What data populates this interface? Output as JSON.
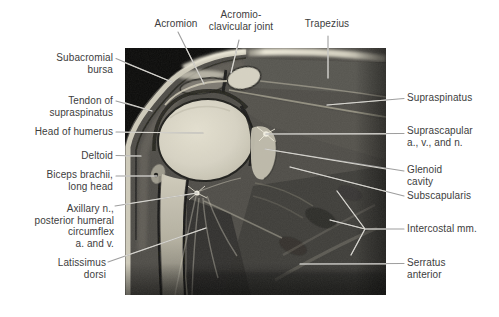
{
  "figure": {
    "type": "labeled-anatomy-mri",
    "region": "shoulder, coronal section"
  },
  "colors": {
    "background": "#ffffff",
    "label_text": "#3d3d3d",
    "leader_line_outside": "#9e9e9e",
    "leader_line_on_image": "#d8d6cf",
    "mri_background": "#0a0a09",
    "muscle_gray": "#4e4c47",
    "bone_marrow_bright": "#d9d5c5",
    "fat_band_bright": "#ece8d8",
    "cortex_dark": "#1e1e1b"
  },
  "labels": {
    "top": {
      "acromion": {
        "lines": [
          "Acromion"
        ]
      },
      "ac_joint": {
        "lines": [
          "Acromio-",
          "clavicular joint"
        ]
      },
      "trapezius": {
        "lines": [
          "Trapezius"
        ]
      }
    },
    "left": {
      "subacromial_bursa": {
        "lines": [
          "Subacromial",
          "bursa"
        ]
      },
      "tendon_supraspinatus": {
        "lines": [
          "Tendon of",
          "supraspinatus"
        ]
      },
      "head_of_humerus": {
        "lines": [
          "Head of humerus"
        ]
      },
      "deltoid": {
        "lines": [
          "Deltoid"
        ]
      },
      "biceps": {
        "lines": [
          "Biceps brachii,",
          "long head"
        ]
      },
      "axillary": {
        "lines": [
          "Axillary n.,",
          "posterior humeral",
          "circumflex",
          "a. and v."
        ]
      },
      "latissimus": {
        "lines": [
          "Latissimus",
          "dorsi"
        ]
      }
    },
    "right": {
      "supraspinatus": {
        "lines": [
          "Supraspinatus"
        ]
      },
      "suprascapular": {
        "lines": [
          "Suprascapular",
          "a., v., and n."
        ]
      },
      "glenoid": {
        "lines": [
          "Glenoid",
          "cavity"
        ]
      },
      "subscapularis": {
        "lines": [
          "Subscapularis"
        ]
      },
      "intercostal": {
        "lines": [
          "Intercostal mm."
        ]
      },
      "serratus": {
        "lines": [
          "Serratus",
          "anterior"
        ]
      }
    }
  }
}
